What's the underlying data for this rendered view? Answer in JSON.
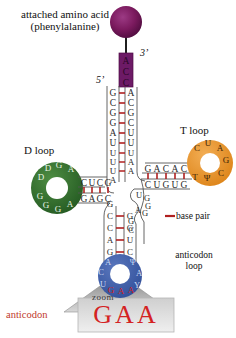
{
  "diagram": {
    "labels": {
      "amino_acid_line1": "attached amino acid",
      "amino_acid_line2": "(phenylalanine)",
      "d_loop": "D loop",
      "t_loop": "T loop",
      "five_prime": "5’",
      "three_prime": "3’",
      "base_pair_legend": "base pair",
      "anticodon_loop_line1": "anticodon",
      "anticodon_loop_line2": "loop",
      "anticodon_label": "anticodon",
      "zoom_label": "zoom"
    },
    "colors": {
      "amino_acid_sphere": "#7b1a5e",
      "acceptor_cap": "#6d1a66",
      "d_loop": "#2f6b2e",
      "t_loop": "#e8932a",
      "anticodon_loop": "#3f5fa8",
      "base_pair": "#b02020",
      "anticodon_text": "#d42222",
      "backbone": "#4a4a4a",
      "nucleotide_text": "#2a2a2a"
    },
    "anticodon_zoom": {
      "bases": [
        "G",
        "A",
        "A"
      ]
    },
    "acceptor_cap_bases": [
      "A",
      "C",
      "C"
    ],
    "acceptor_stem": {
      "five_side": [
        "G",
        "C",
        "G",
        "G",
        "A"
      ],
      "three_side": [
        "A",
        "C",
        "G",
        "C",
        "U",
        "U"
      ]
    },
    "d_stem": {
      "top_strand": [
        "C",
        "U",
        "C",
        "G"
      ],
      "bottom_strand": [
        "G",
        "A",
        "G",
        "C"
      ]
    },
    "d_arm_connector": {
      "left_column": [
        "G",
        "A",
        "U",
        "U",
        "U",
        "A"
      ],
      "right_column": [
        "U",
        "U",
        "A",
        "A"
      ]
    },
    "d_loop_bases": {
      "upper": [
        "D",
        "D",
        "G",
        "A"
      ],
      "lower": [
        "G",
        "G",
        "G",
        "A"
      ]
    },
    "t_stem": {
      "top_strand": [
        "G",
        "A",
        "C",
        "A",
        "C"
      ],
      "bottom_strand": [
        "C",
        "U",
        "G",
        "U",
        "G"
      ]
    },
    "t_loop_bases": [
      "C",
      "U",
      "A",
      "G",
      "C",
      "Ψ",
      "T"
    ],
    "variable_loop": [
      "U",
      "G",
      "G",
      "A",
      "G",
      "G",
      "C"
    ],
    "anticodon_stem": {
      "five_side": [
        "G",
        "C",
        "C",
        "A",
        "G"
      ],
      "three_side": [
        "G",
        "G",
        "U",
        "C"
      ]
    },
    "anticodon_loop_bases": {
      "left": [
        "A",
        "C",
        "U"
      ],
      "bottom": [
        "G",
        "A",
        "A"
      ],
      "right": [
        "Ψ",
        "A",
        "Y"
      ]
    }
  }
}
